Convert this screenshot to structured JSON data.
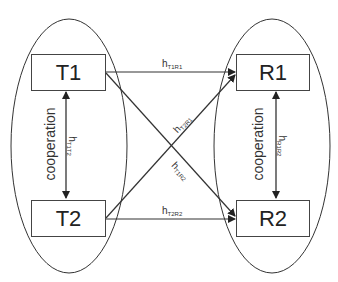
{
  "nodes": {
    "t1": "T1",
    "t2": "T2",
    "r1": "R1",
    "r2": "R2"
  },
  "groups": {
    "transmitters_label": "cooperation",
    "receivers_label": "cooperation"
  },
  "links": {
    "t1r1": {
      "base": "h",
      "sub": "T1R1"
    },
    "t2r1": {
      "base": "h",
      "sub": "T2R1"
    },
    "t1r2": {
      "base": "h",
      "sub": "T1R2"
    },
    "t2r2": {
      "base": "h",
      "sub": "T2R2"
    },
    "t1t2": {
      "base": "h",
      "sub": "T1T2"
    },
    "r1r2": {
      "base": "h",
      "sub": "R1R2"
    }
  },
  "colors": {
    "stroke": "#333333",
    "text": "#222222"
  }
}
